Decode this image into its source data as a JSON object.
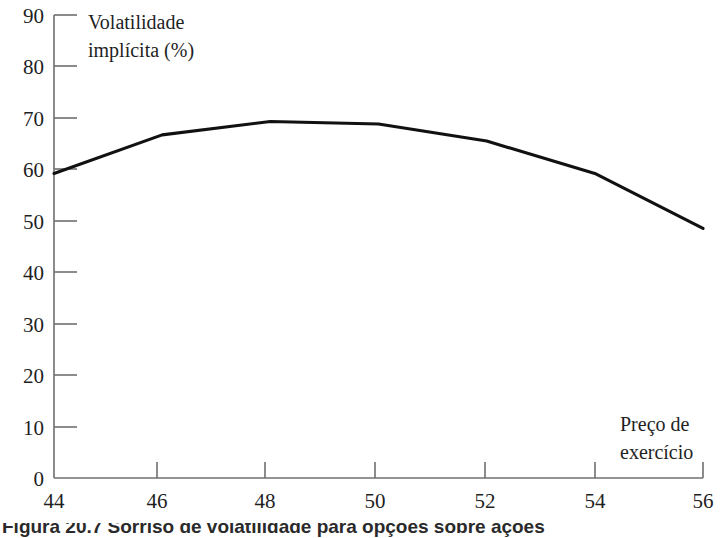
{
  "chart_data": {
    "type": "line",
    "title": "",
    "ylabel": "Volatilidade\nimplícita (%)",
    "ylabel_line1": "Volatilidade",
    "ylabel_line2": "implícita (%)",
    "xlabel": "Preço de\nexercício",
    "xlabel_line1": "Preço de",
    "xlabel_line2": "exercício",
    "x": [
      44,
      46,
      48,
      50,
      52,
      54,
      56
    ],
    "values": [
      59.2,
      66.7,
      69.3,
      68.8,
      65.5,
      59.2,
      48.5
    ],
    "series": [
      {
        "name": "Volatilidade implícita",
        "values": [
          59.2,
          66.7,
          69.3,
          68.8,
          65.5,
          59.2,
          48.5
        ],
        "color": "#111111"
      }
    ],
    "xlim": [
      44,
      56
    ],
    "ylim": [
      0,
      90
    ],
    "xticks": [
      44,
      46,
      48,
      50,
      52,
      54,
      56
    ],
    "yticks": [
      0,
      10,
      20,
      30,
      40,
      50,
      60,
      70,
      80,
      90
    ],
    "xtick_labels": [
      "44",
      "46",
      "48",
      "50",
      "52",
      "54",
      "56"
    ],
    "ytick_labels": [
      "0",
      "10",
      "20",
      "30",
      "40",
      "50",
      "60",
      "70",
      "80",
      "90"
    ],
    "grid": false,
    "legend": false,
    "legend_position": "none",
    "line_color": "#111111",
    "axis_color": "#6f6f6f"
  },
  "caption": {
    "text": "Figura 20.7   Sorriso de volatilidade para opções sobre ações"
  }
}
